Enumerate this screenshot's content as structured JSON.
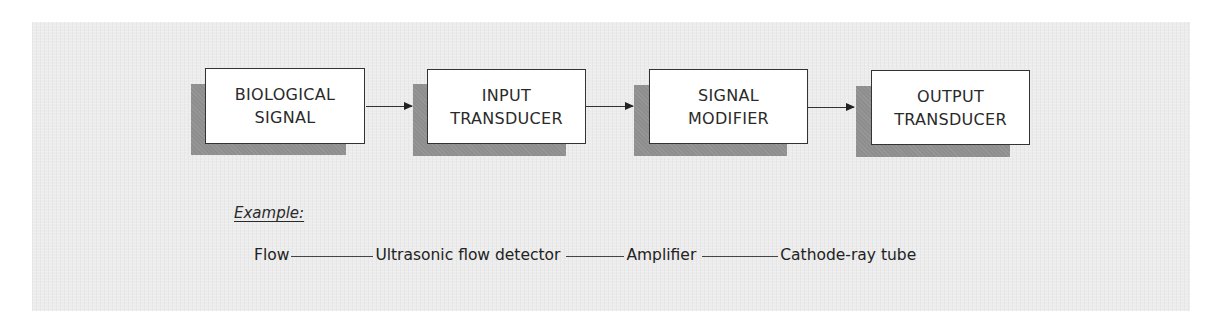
{
  "diagram": {
    "type": "block-flow",
    "blocks": [
      {
        "id": "biological-signal",
        "lines": [
          "BIOLOGICAL",
          "SIGNAL"
        ]
      },
      {
        "id": "input-transducer",
        "lines": [
          "INPUT",
          "TRANSDUCER"
        ]
      },
      {
        "id": "signal-modifier",
        "lines": [
          "SIGNAL",
          "MODIFIER"
        ]
      },
      {
        "id": "output-transducer",
        "lines": [
          "OUTPUT",
          "TRANSDUCER"
        ]
      }
    ],
    "edges": [
      {
        "from": "biological-signal",
        "to": "input-transducer"
      },
      {
        "from": "input-transducer",
        "to": "signal-modifier"
      },
      {
        "from": "signal-modifier",
        "to": "output-transducer"
      }
    ]
  },
  "example": {
    "label": "Example:",
    "chain": [
      "Flow",
      "Ultrasonic flow detector",
      "Amplifier",
      "Cathode-ray tube"
    ]
  },
  "colors": {
    "panel_background": "#ececec",
    "box_fill": "#ffffff",
    "box_shadow": "#8e8e8e",
    "line": "#333333"
  }
}
